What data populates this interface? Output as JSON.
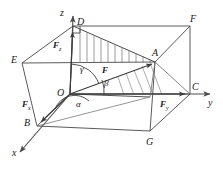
{
  "figure": {
    "stroke_color": "#555555",
    "hatch_color": "#777777",
    "text_color": "#1a1a1a",
    "background": "#ffffff"
  },
  "axes": [
    {
      "name": "x-axis",
      "label": "x"
    },
    {
      "name": "y-axis",
      "label": "y"
    },
    {
      "name": "z-axis",
      "label": "z"
    }
  ],
  "vertices": [
    {
      "name": "vertex-O",
      "label": "O"
    },
    {
      "name": "vertex-A",
      "label": "A"
    },
    {
      "name": "vertex-B",
      "label": "B"
    },
    {
      "name": "vertex-C",
      "label": "C"
    },
    {
      "name": "vertex-D",
      "label": "D"
    },
    {
      "name": "vertex-E",
      "label": "E"
    },
    {
      "name": "vertex-F-top",
      "label": "F"
    },
    {
      "name": "vertex-G",
      "label": "G"
    }
  ],
  "forces": [
    {
      "name": "force-resultant",
      "symbol": "F",
      "subscript": ""
    },
    {
      "name": "force-x-component",
      "symbol": "F",
      "subscript": "x"
    },
    {
      "name": "force-y-component",
      "symbol": "F",
      "subscript": "y"
    },
    {
      "name": "force-z-component",
      "symbol": "F",
      "subscript": "z"
    }
  ],
  "angles": [
    {
      "name": "angle-alpha",
      "label": "α"
    },
    {
      "name": "angle-beta",
      "label": "β"
    },
    {
      "name": "angle-gamma",
      "label": "γ"
    }
  ]
}
